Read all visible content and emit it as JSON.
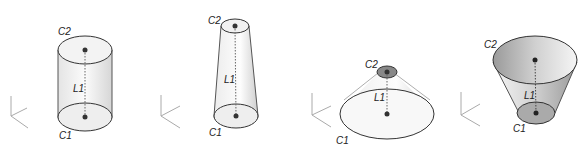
{
  "figures": [
    {
      "name": "cylinder",
      "labels": {
        "top": "C2",
        "axis": "L1",
        "bottom": "C1"
      }
    },
    {
      "name": "tapered-cylinder",
      "labels": {
        "top": "C2",
        "axis": "L1",
        "bottom": "C1"
      }
    },
    {
      "name": "cone-frustum",
      "labels": {
        "top": "C2",
        "axis": "L1",
        "bottom": "C1"
      }
    },
    {
      "name": "inverted-frustum",
      "labels": {
        "top": "C2",
        "axis": "L1",
        "bottom": "C1"
      }
    }
  ]
}
